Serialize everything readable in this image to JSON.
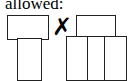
{
  "caption": "allowed:",
  "separator": {
    "icon": "x-mark-icon",
    "glyph": "✗"
  },
  "figures": [
    {
      "name": "left-figure",
      "description": "top box over one narrower bottom box"
    },
    {
      "name": "right-figure",
      "description": "top box over two separated bottom boxes"
    }
  ]
}
